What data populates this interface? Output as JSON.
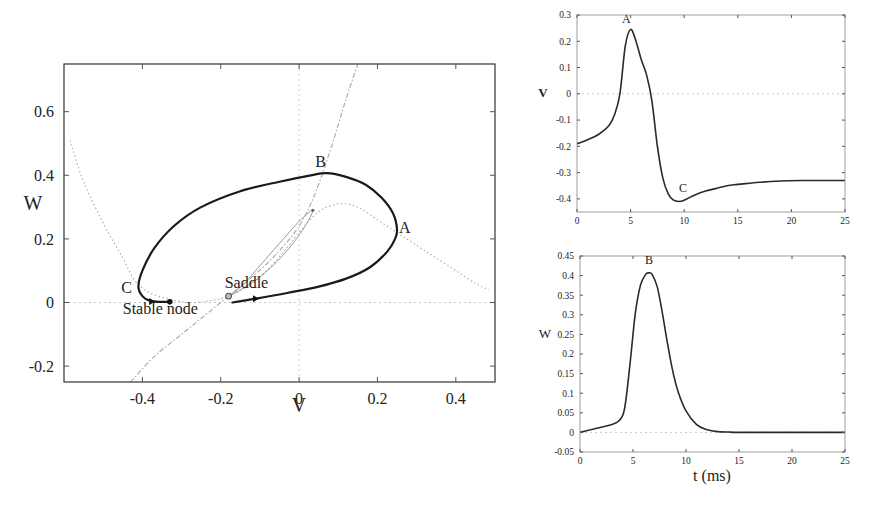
{
  "chart_data": [
    {
      "id": "phase_plane",
      "type": "line",
      "title": "",
      "xlabel": "V",
      "ylabel": "W",
      "xlim": [
        -0.6,
        0.5
      ],
      "ylim": [
        -0.25,
        0.75
      ],
      "xticks": [
        -0.4,
        -0.2,
        0,
        0.2,
        0.4
      ],
      "xtick_labels": [
        "-0.4",
        "-0.2",
        "0",
        "0.2",
        "0.4"
      ],
      "yticks": [
        -0.2,
        0,
        0.2,
        0.4,
        0.6
      ],
      "ytick_labels": [
        "-0.2",
        "0",
        "0.2",
        "0.4",
        "0.6"
      ],
      "grid": false,
      "reference_lines": {
        "x": 0,
        "y": 0
      },
      "series": [
        {
          "name": "V-nullcline",
          "style": "dotted",
          "points": [
            [
              -0.585,
              0.51
            ],
            [
              -0.55,
              0.38
            ],
            [
              -0.5,
              0.25
            ],
            [
              -0.45,
              0.14
            ],
            [
              -0.42,
              0.07
            ],
            [
              -0.38,
              0.03
            ],
            [
              -0.33,
              0.01
            ],
            [
              -0.28,
              0.0
            ],
            [
              -0.23,
              0.005
            ],
            [
              -0.18,
              0.02
            ],
            [
              -0.12,
              0.06
            ],
            [
              -0.06,
              0.13
            ],
            [
              0.0,
              0.22
            ],
            [
              0.05,
              0.285
            ],
            [
              0.1,
              0.31
            ],
            [
              0.15,
              0.3
            ],
            [
              0.2,
              0.26
            ],
            [
              0.25,
              0.22
            ],
            [
              0.3,
              0.18
            ],
            [
              0.35,
              0.14
            ],
            [
              0.4,
              0.1
            ],
            [
              0.45,
              0.06
            ],
            [
              0.485,
              0.04
            ]
          ]
        },
        {
          "name": "W-nullcline",
          "style": "dash-dot",
          "points": [
            [
              -0.43,
              -0.25
            ],
            [
              -0.37,
              -0.17
            ],
            [
              -0.3,
              -0.1
            ],
            [
              -0.24,
              -0.04
            ],
            [
              -0.18,
              0.02
            ],
            [
              -0.12,
              0.08
            ],
            [
              -0.06,
              0.15
            ],
            [
              0.0,
              0.24
            ],
            [
              0.04,
              0.34
            ],
            [
              0.08,
              0.48
            ],
            [
              0.12,
              0.64
            ],
            [
              0.15,
              0.75
            ]
          ]
        },
        {
          "name": "Saddle unstable manifold",
          "style": "thin",
          "points": [
            [
              -0.18,
              0.02
            ],
            [
              -0.14,
              0.06
            ],
            [
              -0.09,
              0.13
            ],
            [
              -0.04,
              0.2
            ],
            [
              0.0,
              0.255
            ],
            [
              0.035,
              0.29
            ],
            [
              0.01,
              0.23
            ],
            [
              -0.04,
              0.15
            ],
            [
              -0.1,
              0.08
            ],
            [
              -0.15,
              0.04
            ],
            [
              -0.18,
              0.02
            ]
          ]
        },
        {
          "name": "Trajectory",
          "style": "solid-bold",
          "points": [
            [
              -0.17,
              0.0
            ],
            [
              -0.11,
              0.012
            ],
            [
              -0.03,
              0.03
            ],
            [
              0.05,
              0.05
            ],
            [
              0.12,
              0.075
            ],
            [
              0.18,
              0.11
            ],
            [
              0.225,
              0.16
            ],
            [
              0.245,
              0.2
            ],
            [
              0.25,
              0.23
            ],
            [
              0.24,
              0.28
            ],
            [
              0.21,
              0.33
            ],
            [
              0.17,
              0.37
            ],
            [
              0.12,
              0.395
            ],
            [
              0.07,
              0.407
            ],
            [
              0.03,
              0.4
            ],
            [
              -0.05,
              0.38
            ],
            [
              -0.15,
              0.35
            ],
            [
              -0.25,
              0.3
            ],
            [
              -0.32,
              0.24
            ],
            [
              -0.37,
              0.17
            ],
            [
              -0.4,
              0.1
            ],
            [
              -0.41,
              0.05
            ],
            [
              -0.4,
              0.02
            ],
            [
              -0.38,
              0.005
            ],
            [
              -0.35,
              0.002
            ],
            [
              -0.33,
              0.002
            ]
          ]
        }
      ],
      "annotations": [
        {
          "text": "A",
          "x": 0.27,
          "y": 0.22
        },
        {
          "text": "B",
          "x": 0.055,
          "y": 0.425
        },
        {
          "text": "C",
          "x": -0.44,
          "y": 0.03
        },
        {
          "text": "Saddle",
          "x": -0.19,
          "y": 0.045
        },
        {
          "text": "Stable node",
          "x": -0.45,
          "y": -0.035
        }
      ],
      "markers": [
        {
          "name": "stable-node",
          "x": -0.33,
          "y": 0.002,
          "shape": "filled-circle"
        },
        {
          "name": "saddle",
          "x": -0.18,
          "y": 0.02,
          "shape": "open-circle"
        },
        {
          "name": "upper-fixed-point",
          "x": 0.035,
          "y": 0.29,
          "shape": "small-dot"
        }
      ],
      "arrows": [
        {
          "x": -0.11,
          "y": 0.012,
          "direction": "right"
        },
        {
          "x": -0.375,
          "y": 0.003,
          "direction": "right"
        }
      ]
    },
    {
      "id": "v_time",
      "type": "line",
      "title": "",
      "xlabel": "",
      "ylabel": "V",
      "xlim": [
        0,
        25
      ],
      "ylim": [
        -0.45,
        0.3
      ],
      "xticks": [
        0,
        5,
        10,
        15,
        20,
        25
      ],
      "xtick_labels": [
        "0",
        "5",
        "10",
        "15",
        "20",
        "25"
      ],
      "yticks": [
        -0.4,
        -0.3,
        -0.2,
        -0.1,
        0,
        0.1,
        0.2,
        0.3
      ],
      "ytick_labels": [
        "-0.4",
        "-0.3",
        "-0.2",
        "-0.1",
        "0",
        "0.1",
        "0.2",
        "0.3"
      ],
      "grid": false,
      "reference_lines": {
        "y": 0
      },
      "series": [
        {
          "name": "V(t)",
          "x": [
            0,
            1,
            2,
            3,
            3.5,
            4,
            4.5,
            5,
            5.5,
            6,
            6.5,
            7,
            7.5,
            8,
            8.5,
            9,
            9.5,
            10,
            11,
            12,
            13,
            14,
            15,
            17,
            19,
            21,
            23,
            25
          ],
          "values": [
            -0.19,
            -0.175,
            -0.155,
            -0.12,
            -0.08,
            0.0,
            0.18,
            0.245,
            0.2,
            0.13,
            0.07,
            -0.03,
            -0.2,
            -0.32,
            -0.38,
            -0.405,
            -0.41,
            -0.405,
            -0.385,
            -0.37,
            -0.36,
            -0.35,
            -0.345,
            -0.337,
            -0.332,
            -0.33,
            -0.33,
            -0.33
          ]
        }
      ],
      "annotations": [
        {
          "text": "A",
          "x": 4.6,
          "y": 0.27
        },
        {
          "text": "C",
          "x": 9.9,
          "y": -0.375
        }
      ]
    },
    {
      "id": "w_time",
      "type": "line",
      "title": "",
      "xlabel": "t (ms)",
      "ylabel": "W",
      "xlim": [
        0,
        25
      ],
      "ylim": [
        -0.05,
        0.45
      ],
      "xticks": [
        0,
        5,
        10,
        15,
        20,
        25
      ],
      "xtick_labels": [
        "0",
        "5",
        "10",
        "15",
        "20",
        "25"
      ],
      "yticks": [
        -0.05,
        0,
        0.05,
        0.1,
        0.15,
        0.2,
        0.25,
        0.3,
        0.35,
        0.4,
        0.45
      ],
      "ytick_labels": [
        "-0.05",
        "0",
        "0.05",
        "0.1",
        "0.15",
        "0.2",
        "0.25",
        "0.3",
        "0.35",
        "0.4",
        "0.45"
      ],
      "grid": false,
      "reference_lines": {
        "y": 0
      },
      "series": [
        {
          "name": "W(t)",
          "x": [
            0,
            1,
            2,
            3,
            3.7,
            4.2,
            4.7,
            5.2,
            5.7,
            6.2,
            6.5,
            6.8,
            7.3,
            7.8,
            8.3,
            8.8,
            9.3,
            10,
            11,
            12,
            13,
            14,
            15,
            20,
            25
          ],
          "values": [
            0.0,
            0.007,
            0.013,
            0.02,
            0.03,
            0.06,
            0.17,
            0.3,
            0.375,
            0.403,
            0.407,
            0.403,
            0.37,
            0.3,
            0.22,
            0.15,
            0.1,
            0.055,
            0.02,
            0.007,
            0.002,
            0.001,
            0.0,
            0.0,
            0.0
          ]
        }
      ],
      "annotations": [
        {
          "text": "B",
          "x": 6.5,
          "y": 0.43
        }
      ]
    }
  ],
  "panels": {
    "phase_plane": {
      "xlabel": "V",
      "ylabel": "W"
    },
    "v_time": {
      "ylabel": "V"
    },
    "w_time": {
      "ylabel": "W",
      "xlabel": "t (ms)"
    }
  }
}
